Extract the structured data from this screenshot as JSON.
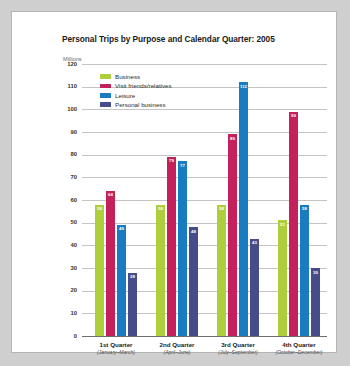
{
  "card": {
    "title": "Personal Trips by Purpose and Calendar Quarter: 2005",
    "y_unit": "Millions"
  },
  "legend": {
    "position": "top-left-inside",
    "items": [
      {
        "label": "Business",
        "color": "#AECE3C"
      },
      {
        "label": "Visit friends/relatives",
        "color": "#C4215C"
      },
      {
        "label": "Leisure",
        "color": "#1A7CC0"
      },
      {
        "label": "Personal business",
        "color": "#464B89"
      }
    ]
  },
  "chart_data": {
    "type": "bar",
    "title": "Personal Trips by Purpose and Calendar Quarter: 2005",
    "xlabel": "",
    "ylabel": "Millions",
    "ylim": [
      0,
      120
    ],
    "ytick_step": 10,
    "yticks": [
      0,
      10,
      20,
      30,
      40,
      50,
      60,
      70,
      80,
      90,
      100,
      110,
      120
    ],
    "grid": true,
    "categories": [
      "1st Quarter",
      "2nd Quarter",
      "3rd Quarter",
      "4th Quarter"
    ],
    "category_sublabels": [
      "(January–March)",
      "(April–June)",
      "(July–September)",
      "(October–December)"
    ],
    "series": [
      {
        "name": "Business",
        "color": "#AECE3C",
        "values": [
          58,
          58,
          58,
          51
        ]
      },
      {
        "name": "Visit friends/relatives",
        "color": "#C4215C",
        "values": [
          64,
          79,
          89,
          99
        ]
      },
      {
        "name": "Leisure",
        "color": "#1A7CC0",
        "values": [
          49,
          77,
          112,
          58
        ]
      },
      {
        "name": "Personal business",
        "color": "#464B89",
        "values": [
          28,
          48,
          43,
          30
        ]
      }
    ]
  }
}
